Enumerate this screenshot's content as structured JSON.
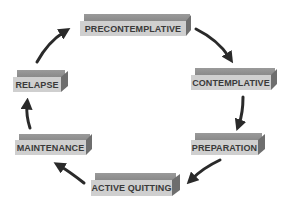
{
  "diagram": {
    "type": "cycle",
    "stages": [
      {
        "id": "precontemplative",
        "label": "PRECONTEMPLATIVE",
        "x": 80,
        "y": 14,
        "w": 106
      },
      {
        "id": "contemplative",
        "label": "CONTEMPLATIVE",
        "x": 191,
        "y": 68,
        "w": 80
      },
      {
        "id": "preparation",
        "label": "PREPARATION",
        "x": 191,
        "y": 133,
        "w": 67
      },
      {
        "id": "active-quitting",
        "label": "ACTIVE QUITTING",
        "x": 91,
        "y": 173,
        "w": 81
      },
      {
        "id": "maintenance",
        "label": "MAINTENANCE",
        "x": 15,
        "y": 134,
        "w": 71
      },
      {
        "id": "relapse",
        "label": "RELAPSE",
        "x": 13,
        "y": 70,
        "w": 48
      }
    ],
    "arrows": [
      {
        "from": "precontemplative",
        "to": "contemplative"
      },
      {
        "from": "contemplative",
        "to": "preparation"
      },
      {
        "from": "preparation",
        "to": "active-quitting"
      },
      {
        "from": "active-quitting",
        "to": "maintenance"
      },
      {
        "from": "maintenance",
        "to": "relapse"
      },
      {
        "from": "relapse",
        "to": "precontemplative"
      }
    ],
    "colors": {
      "box_front": "#cfcfcf",
      "box_top": "#8f8f8f",
      "box_side": "#6e6e6e",
      "label_text": "#3a3a3a",
      "arrow": "#2a2a2a"
    }
  }
}
